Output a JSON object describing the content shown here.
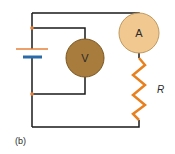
{
  "diagram": {
    "type": "circuit",
    "caption": "(b)",
    "components": {
      "voltmeter": {
        "label": "V",
        "fill": "#a87c3c",
        "stroke": "#7a5520"
      },
      "ammeter": {
        "label": "A",
        "fill": "#f0c890",
        "stroke": "#c09a60"
      },
      "resistor": {
        "label": "R",
        "color": "#e8801e"
      },
      "battery": {
        "positive_color": "#e8803a",
        "negative_color": "#2a6aa8"
      }
    },
    "junction_color": "#e8803a",
    "wire_color": "#1a1a1a"
  }
}
